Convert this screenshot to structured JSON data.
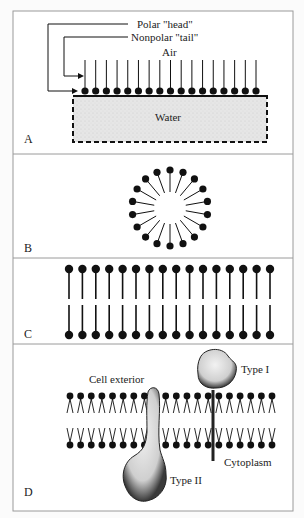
{
  "figure": {
    "panels": [
      {
        "letter": "A",
        "title": "Monolayer at air-water interface",
        "labels": {
          "head": "Polar \"head\"",
          "tail": "Nonpolar \"tail\"",
          "air": "Air",
          "water": "Water"
        },
        "molecule_count": 17
      },
      {
        "letter": "B",
        "title": "Micelle",
        "molecule_count": 18
      },
      {
        "letter": "C",
        "title": "Bilayer",
        "molecule_count_per_leaflet": 16
      },
      {
        "letter": "D",
        "title": "Membrane with proteins",
        "labels": {
          "exterior": "Cell exterior",
          "type1": "Type I",
          "type2": "Type II",
          "cytoplasm": "Cytoplasm"
        },
        "molecule_count_per_leaflet": 20
      }
    ],
    "colors": {
      "ink": "#111111",
      "frame": "#9a9a9a",
      "water_fill": "#e9e9e9",
      "protein_fill": "#dcdcdc"
    }
  }
}
